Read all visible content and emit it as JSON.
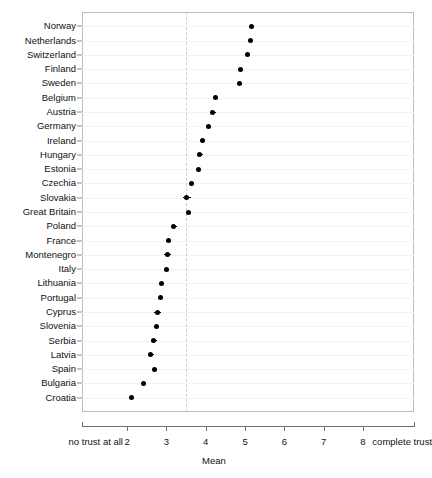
{
  "chart_data": {
    "type": "scatter",
    "title": "",
    "subtitle": "",
    "xlabel": "Mean",
    "ylabel": "",
    "xlim": [
      0.8,
      9.35
    ],
    "ylim_categories": 28,
    "grid": true,
    "legend": null,
    "orientation": "horizontal-dotplot",
    "reference_line": {
      "value": 3.5,
      "style": "dashed",
      "color": "#cfcfcf"
    },
    "x_axis": {
      "tick_values": [
        2,
        3,
        4,
        5,
        6,
        7,
        8
      ],
      "tick_labels": [
        "2",
        "3",
        "4",
        "5",
        "6",
        "7",
        "8"
      ],
      "left_anchor_label": "no trust at all",
      "right_anchor_label": "complete trust",
      "left_anchor_value": 1.2,
      "right_anchor_value": 9.0,
      "axis_start": 0.85,
      "axis_end": 9.3
    },
    "categories": [
      "Norway",
      "Netherlands",
      "Switzerland",
      "Finland",
      "Sweden",
      "Belgium",
      "Austria",
      "Germany",
      "Ireland",
      "Hungary",
      "Estonia",
      "Czechia",
      "Slovakia",
      "Great Britain",
      "Poland",
      "France",
      "Montenegro",
      "Italy",
      "Lithuania",
      "Portugal",
      "Cyprus",
      "Slovenia",
      "Serbia",
      "Latvia",
      "Spain",
      "Bulgaria",
      "Croatia"
    ],
    "values": [
      5.16,
      5.15,
      5.06,
      4.88,
      4.85,
      4.25,
      4.18,
      4.07,
      3.92,
      3.85,
      3.81,
      3.63,
      3.52,
      3.57,
      3.19,
      3.06,
      3.03,
      2.99,
      2.88,
      2.85,
      2.78,
      2.75,
      2.68,
      2.6,
      2.7,
      2.42,
      2.11
    ],
    "error_half_widths": [
      0.07,
      0.06,
      0.06,
      0.06,
      0.06,
      0.07,
      0.07,
      0.05,
      0.06,
      0.08,
      0.06,
      0.06,
      0.1,
      0.06,
      0.07,
      0.06,
      0.09,
      0.06,
      0.06,
      0.07,
      0.09,
      0.06,
      0.07,
      0.07,
      0.05,
      0.06,
      0.05
    ],
    "series_name": "Mean trust",
    "point_color": "#000000",
    "point_marker": "filled-circle"
  }
}
